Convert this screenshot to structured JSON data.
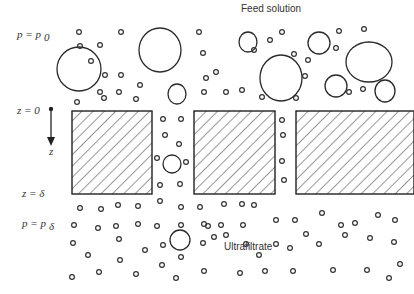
{
  "labels": {
    "feed": "Feed solution",
    "ultrafiltrate": "Ultrafiltrate",
    "pressure_top": "p = p",
    "pressure_top_sub": "0",
    "z_zero": "z = 0",
    "z_axis": "z",
    "z_delta": "z = δ",
    "pressure_bottom": "p = p",
    "pressure_bottom_sub": "δ"
  },
  "membrane": {
    "block_count": 3,
    "pore_count": 2
  },
  "colors": {
    "ink": "#333333",
    "background": "#ffffff"
  }
}
